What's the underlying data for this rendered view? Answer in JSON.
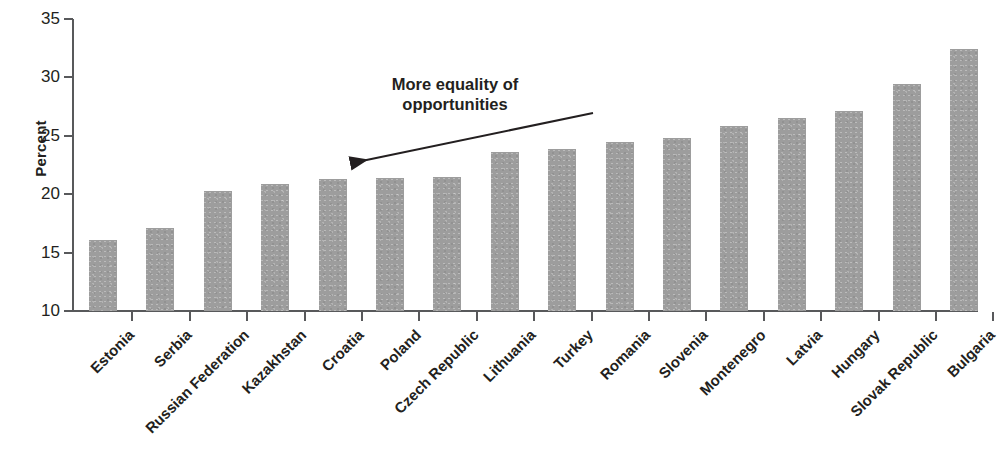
{
  "chart_data": {
    "type": "bar",
    "title": "",
    "subtitle": "",
    "xlabel": "",
    "ylabel": "Percent",
    "ylim": [
      10,
      35
    ],
    "ytick_values": [
      35,
      30,
      25,
      20,
      15,
      10
    ],
    "ytick_labels": [
      "35",
      "30",
      "25",
      "20",
      "15",
      "10"
    ],
    "grid": false,
    "legend": null,
    "bar_color": "#9d9d9d",
    "axis_color": "#58595b",
    "text_color": "#231f20",
    "categories": [
      "Estonia",
      "Serbia",
      "Russian Federation",
      "Kazakhstan",
      "Croatia",
      "Poland",
      "Czech Republic",
      "Lithuania",
      "Turkey",
      "Romania",
      "Slovenia",
      "Montenegro",
      "Latvia",
      "Hungary",
      "Slovak Republic",
      "Bulgaria"
    ],
    "values": [
      16.1,
      17.1,
      20.3,
      20.9,
      21.3,
      21.4,
      21.5,
      23.6,
      23.9,
      24.5,
      24.8,
      25.8,
      26.5,
      27.1,
      29.4,
      32.4
    ],
    "annotations": [
      {
        "text_line1": "More equality of",
        "text_line2": "opportunities",
        "arrow_direction": "left",
        "arrow_from": [
          593,
          113
        ],
        "arrow_to": [
          345,
          163
        ]
      }
    ]
  }
}
